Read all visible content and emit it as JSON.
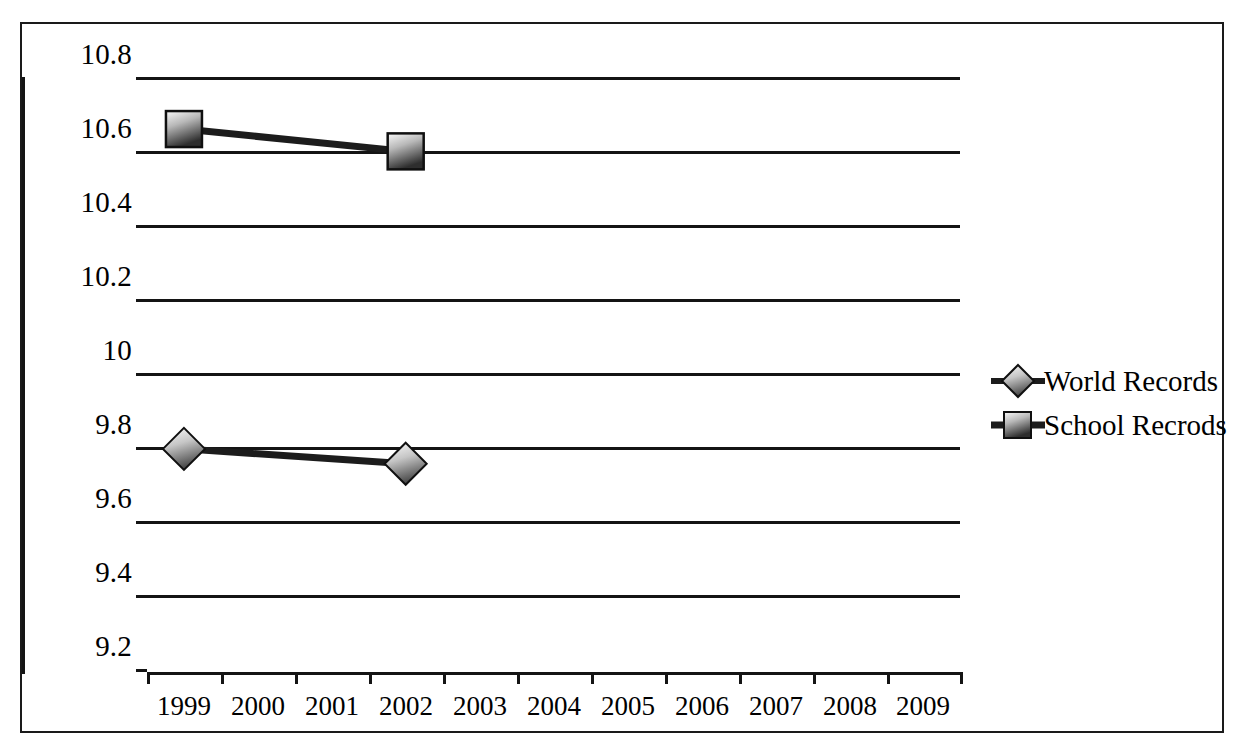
{
  "chart_data": {
    "type": "line",
    "title": "",
    "xlabel": "",
    "ylabel": "",
    "categories": [
      "1999",
      "2000",
      "2001",
      "2002",
      "2003",
      "2004",
      "2005",
      "2006",
      "2007",
      "2008",
      "2009"
    ],
    "ylim": [
      9.2,
      10.8
    ],
    "ytick_step": 0.2,
    "yticks": [
      "10.8",
      "10.6",
      "10.4",
      "10.2",
      "10",
      "9.8",
      "9.6",
      "9.4",
      "9.2"
    ],
    "ytick_values": [
      10.8,
      10.6,
      10.4,
      10.2,
      10.0,
      9.8,
      9.6,
      9.4,
      9.2
    ],
    "grid": "horizontal",
    "legend_position": "right",
    "series": [
      {
        "name": "World Records",
        "marker": "diamond",
        "x": [
          "1999",
          "2002"
        ],
        "values": [
          9.8,
          9.76
        ]
      },
      {
        "name": "School Recrods",
        "marker": "square",
        "x": [
          "1999",
          "2002"
        ],
        "values": [
          10.66,
          10.6
        ]
      }
    ]
  },
  "legend": {
    "items": [
      {
        "label": "World Records",
        "marker": "diamond-marker-icon"
      },
      {
        "label": "School Recrods",
        "marker": "square-marker-icon"
      }
    ]
  },
  "colors": {
    "axis": "#141414",
    "gridline": "#141414",
    "series_line": "#1c1c1c",
    "marker_light": "#f2f2f2",
    "marker_dark": "#3d3d3d",
    "marker_border": "#101010",
    "frame": "#1a1a1a",
    "background": "#ffffff"
  }
}
